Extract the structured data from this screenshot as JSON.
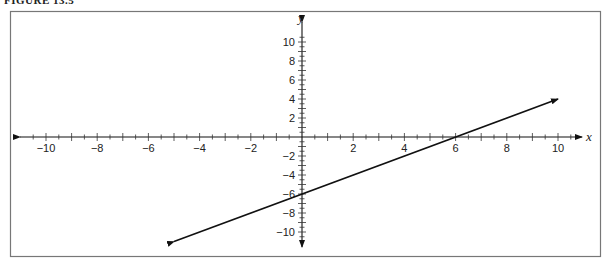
{
  "figure": {
    "caption": "FIGURE 13.5"
  },
  "chart_data": {
    "type": "line",
    "title": "",
    "xlabel": "x",
    "ylabel": "y",
    "xlim": [
      -11,
      11
    ],
    "ylim": [
      -11,
      11
    ],
    "grid": false,
    "x_ticks_labeled": [
      -10,
      -8,
      -6,
      -4,
      -2,
      2,
      4,
      6,
      8,
      10
    ],
    "y_ticks_labeled": [
      10,
      8,
      6,
      4,
      2,
      -2,
      -4,
      -6,
      -8,
      -10
    ],
    "minor_tick_step": 0.5,
    "series": [
      {
        "name": "line",
        "equation": "y = x - 6",
        "slope": 1,
        "y_intercept": -6,
        "x_intercept": 6,
        "x": [
          -5,
          10
        ],
        "y": [
          -11,
          4
        ],
        "arrows": "both ends",
        "color": "#111111"
      }
    ]
  }
}
